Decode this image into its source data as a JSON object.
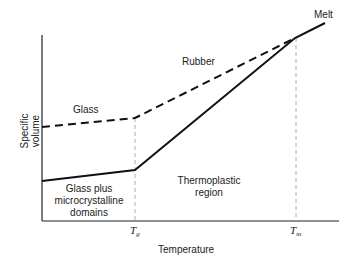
{
  "diagram": {
    "axes": {
      "y_label_line1": "Specific",
      "y_label_line2": "volume",
      "x_label": "Temperature",
      "x_ticks": [
        {
          "symbol": "T",
          "subscript": "g"
        },
        {
          "symbol": "T",
          "subscript": "m"
        }
      ]
    },
    "regions": {
      "glass": "Glass",
      "rubber": "Rubber",
      "melt": "Melt",
      "glass_plus_line1": "Glass plus",
      "glass_plus_line2": "microcrystalline",
      "glass_plus_line3": "domains",
      "thermoplastic_line1": "Thermoplastic",
      "thermoplastic_line2": "region"
    },
    "curves": [
      {
        "name": "amorphous (dashed)",
        "style": "dashed",
        "points": [
          [
            42,
            127
          ],
          [
            135,
            118
          ],
          [
            295,
            38
          ]
        ]
      },
      {
        "name": "semicrystalline (solid)",
        "style": "solid",
        "points": [
          [
            42,
            181
          ],
          [
            135,
            170
          ],
          [
            295,
            38
          ],
          [
            325,
            23
          ]
        ]
      }
    ],
    "colors": {
      "line": "#111111",
      "guide": "#999999",
      "text": "#222222"
    }
  }
}
